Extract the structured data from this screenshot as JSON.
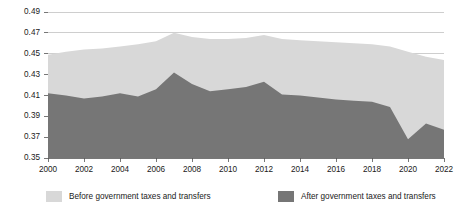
{
  "chart_data": {
    "type": "area",
    "title": "",
    "subtitle": "",
    "xlabel": "",
    "ylabel": "",
    "stacked": false,
    "grid": true,
    "legend_position": "bottom",
    "xlim": [
      2000,
      2022
    ],
    "ylim": [
      0.35,
      0.49
    ],
    "ytick_step": 0.02,
    "xtick_step": 2,
    "x": [
      2000,
      2001,
      2002,
      2003,
      2004,
      2005,
      2006,
      2007,
      2008,
      2009,
      2010,
      2011,
      2012,
      2013,
      2014,
      2015,
      2016,
      2017,
      2018,
      2019,
      2020,
      2021,
      2022
    ],
    "xtick_labels": [
      "2000",
      "2002",
      "2004",
      "2006",
      "2008",
      "2010",
      "2012",
      "2014",
      "2016",
      "2018",
      "2020",
      "2022"
    ],
    "ytick_labels": [
      "0.35",
      "0.37",
      "0.39",
      "0.41",
      "0.43",
      "0.45",
      "0.47",
      "0.49"
    ],
    "series": [
      {
        "name": "Before government taxes and transfers",
        "color": "#d8d8d8",
        "values": [
          0.449,
          0.452,
          0.454,
          0.455,
          0.457,
          0.459,
          0.462,
          0.47,
          0.466,
          0.464,
          0.464,
          0.465,
          0.468,
          0.464,
          0.463,
          0.462,
          0.461,
          0.46,
          0.459,
          0.457,
          0.452,
          0.447,
          0.444
        ]
      },
      {
        "name": "After government taxes and transfers",
        "color": "#767676",
        "values": [
          0.412,
          0.41,
          0.407,
          0.409,
          0.412,
          0.409,
          0.416,
          0.432,
          0.421,
          0.414,
          0.416,
          0.418,
          0.423,
          0.411,
          0.41,
          0.408,
          0.406,
          0.405,
          0.404,
          0.399,
          0.368,
          0.383,
          0.377
        ]
      }
    ],
    "legend": [
      {
        "label": "Before government taxes and transfers",
        "color": "#d8d8d8"
      },
      {
        "label": "After government taxes and transfers",
        "color": "#767676"
      }
    ]
  }
}
